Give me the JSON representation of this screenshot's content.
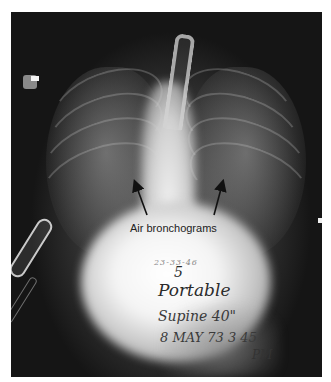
{
  "image": {
    "description": "Portable supine chest radiograph (neonate/infant) with annotation",
    "annotation": {
      "label": "Air bronchograms",
      "arrow_count": 2
    },
    "handwriting": {
      "date_stamp": "23-33-46",
      "number": "5",
      "line1": "Portable",
      "line2": "Supine 40\"",
      "line3": "8 MAY 73  3 45",
      "line4": "PM"
    },
    "colors": {
      "background": "#ffffff",
      "film_dark": "#1a1a1a",
      "film_bright": "#f4f4f4",
      "label_text": "#222222"
    }
  }
}
